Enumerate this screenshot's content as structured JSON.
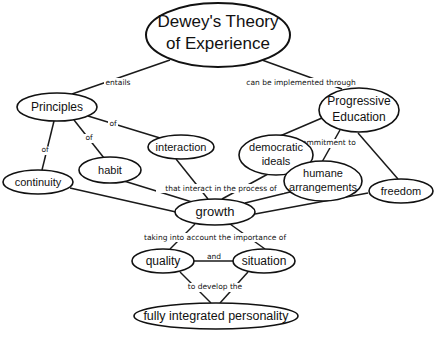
{
  "diagram": {
    "type": "concept-map",
    "nodes": {
      "dewey": {
        "line1": "Dewey's Theory",
        "line2": "of Experience"
      },
      "principles": {
        "label": "Principles"
      },
      "progressive": {
        "line1": "Progressive",
        "line2": "Education"
      },
      "interaction": {
        "label": "interaction"
      },
      "habit": {
        "label": "habit"
      },
      "continuity": {
        "label": "continuity"
      },
      "democratic": {
        "line1": "democratic",
        "line2": "ideals"
      },
      "humane": {
        "line1": "humane",
        "line2": "arrangements"
      },
      "freedom": {
        "label": "freedom"
      },
      "growth": {
        "label": "growth"
      },
      "quality": {
        "label": "quality"
      },
      "situation": {
        "label": "situation"
      },
      "personality": {
        "label": "fully integrated personality"
      }
    },
    "links": {
      "entails": "entails",
      "implemented": "can be implemented through",
      "of_interaction": "of",
      "of_habit": "of",
      "of_continuity": "of",
      "commitment": "by commitment to",
      "interact": "that interact in the process of",
      "importance": "taking into account the importance of",
      "and": "and",
      "develop": "to develop the"
    }
  }
}
